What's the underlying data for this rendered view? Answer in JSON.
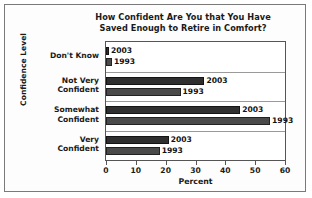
{
  "figure": {
    "title_lines": [
      "How Confident Are You that You Have",
      "Saved Enough to Retire in Comfort?"
    ],
    "border_color": "#7a7a7a",
    "background": "#fdfdfd"
  },
  "chart_data": {
    "type": "bar",
    "orientation": "horizontal",
    "title": "How Confident Are You that You Have Saved Enough to Retire in Comfort?",
    "xlabel": "Percent",
    "ylabel": "Confidence Level",
    "categories": [
      "Don't Know",
      "Not Very Confident",
      "Somewhat Confident",
      "Very Confident"
    ],
    "category_lines": [
      [
        "Don't Know"
      ],
      [
        "Not Very",
        "Confident"
      ],
      [
        "Somewhat",
        "Confident"
      ],
      [
        "Very",
        "Confident"
      ]
    ],
    "series": [
      {
        "name": "2003",
        "values": [
          1,
          33,
          45,
          21
        ],
        "color": "#2f2f2f"
      },
      {
        "name": "1993",
        "values": [
          2,
          25,
          55,
          18
        ],
        "color": "#4a4a4a"
      }
    ],
    "xlim": [
      0,
      60
    ],
    "xticks": [
      0,
      10,
      20,
      30,
      40,
      50,
      60
    ],
    "xtick_labels": [
      "0",
      "10",
      "20",
      "30",
      "40",
      "50",
      "60"
    ],
    "grid": false,
    "legend": "inline-bar-labels",
    "bar_value_labels": [
      {
        "category": "Don't Know",
        "series": "2003",
        "label": "2003"
      },
      {
        "category": "Don't Know",
        "series": "1993",
        "label": "1993"
      },
      {
        "category": "Not Very Confident",
        "series": "2003",
        "label": "2003"
      },
      {
        "category": "Not Very Confident",
        "series": "1993",
        "label": "1993"
      },
      {
        "category": "Somewhat Confident",
        "series": "2003",
        "label": "2003"
      },
      {
        "category": "Somewhat Confident",
        "series": "1993",
        "label": "1993"
      },
      {
        "category": "Very Confident",
        "series": "2003",
        "label": "2003"
      },
      {
        "category": "Very Confident",
        "series": "1993",
        "label": "1993"
      }
    ]
  }
}
